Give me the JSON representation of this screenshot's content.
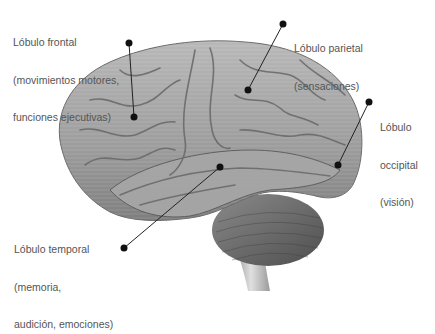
{
  "diagram": {
    "colors": {
      "text": "#555555",
      "leader": "#222222",
      "dot": "#111111",
      "cortex": "#9a9a9a",
      "cerebellum": "#6f6f6f"
    },
    "labels": [
      {
        "id": "frontal",
        "lines": [
          "Lóbulo frontal",
          "(movimientos motores,",
          "funciones ejecutivas)"
        ]
      },
      {
        "id": "parietal",
        "lines": [
          "Lóbulo parietal",
          "(sensaciones)"
        ]
      },
      {
        "id": "occipital",
        "lines": [
          "Lóbulo",
          "occipital",
          "(visión)"
        ]
      },
      {
        "id": "temporal",
        "lines": [
          "Lóbulo temporal",
          "(memoria,",
          "audición, emociones)"
        ]
      }
    ]
  }
}
